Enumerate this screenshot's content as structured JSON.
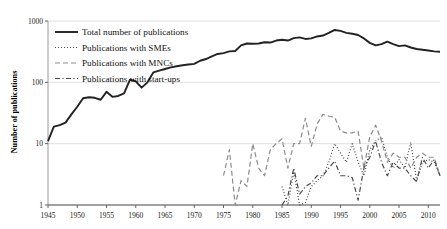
{
  "chart_data": {
    "type": "line",
    "title": "",
    "xlabel": "",
    "ylabel": "Number of publications",
    "yscale": "log",
    "ylim": [
      1,
      1000
    ],
    "xlim": [
      1945,
      2012
    ],
    "grid": true,
    "legend_position": "top-left",
    "ytick_labels": [
      "1000",
      "100",
      "10",
      "1"
    ],
    "ytick_values": [
      1000,
      100,
      10,
      1
    ],
    "xtick_labels": [
      "1945",
      "1950",
      "1955",
      "1960",
      "1965",
      "1970",
      "1975",
      "1980",
      "1985",
      "1990",
      "1995",
      "2000",
      "2005",
      "2010"
    ],
    "xtick_values": [
      1945,
      1950,
      1955,
      1960,
      1965,
      1970,
      1975,
      1980,
      1985,
      1990,
      1995,
      2000,
      2005,
      2010
    ],
    "series": [
      {
        "name": "Total number of publications",
        "style": "solid",
        "color": "#222222",
        "width": 1.9,
        "x": [
          1945,
          1946,
          1947,
          1948,
          1949,
          1950,
          1951,
          1952,
          1953,
          1954,
          1955,
          1956,
          1957,
          1958,
          1959,
          1960,
          1961,
          1962,
          1963,
          1964,
          1965,
          1966,
          1967,
          1968,
          1969,
          1970,
          1971,
          1972,
          1973,
          1974,
          1975,
          1976,
          1977,
          1978,
          1979,
          1980,
          1981,
          1982,
          1983,
          1984,
          1985,
          1986,
          1987,
          1988,
          1989,
          1990,
          1991,
          1992,
          1993,
          1994,
          1995,
          1996,
          1997,
          1998,
          1999,
          2000,
          2001,
          2002,
          2003,
          2004,
          2005,
          2006,
          2007,
          2008,
          2009,
          2010,
          2011,
          2012
        ],
        "values": [
          11,
          19,
          20,
          22,
          30,
          40,
          55,
          57,
          56,
          52,
          70,
          58,
          60,
          66,
          110,
          104,
          82,
          100,
          145,
          155,
          165,
          175,
          183,
          190,
          195,
          200,
          225,
          240,
          265,
          290,
          300,
          320,
          325,
          400,
          430,
          425,
          430,
          450,
          445,
          480,
          495,
          480,
          525,
          540,
          510,
          520,
          560,
          580,
          640,
          715,
          690,
          640,
          620,
          590,
          520,
          440,
          400,
          420,
          460,
          420,
          390,
          400,
          370,
          350,
          340,
          330,
          320,
          315
        ]
      },
      {
        "name": "Publications with SMEs",
        "style": "dotted",
        "color": "#3a3a3a",
        "width": 1.2,
        "x": [
          1985,
          1986,
          1987,
          1988,
          1989,
          1990,
          1991,
          1992,
          1993,
          1994,
          1995,
          1996,
          1997,
          1998,
          1999,
          2000,
          2001,
          2002,
          2003,
          2004,
          2005,
          2006,
          2007,
          2008,
          2009,
          2010,
          2011,
          2012
        ],
        "values": [
          2,
          1,
          3.5,
          1,
          1.1,
          2,
          2.5,
          3,
          5,
          10,
          7,
          5,
          10,
          5,
          3,
          8,
          11,
          13,
          6,
          4,
          5.5,
          4,
          10.5,
          2.5,
          5,
          5.5,
          5,
          3
        ]
      },
      {
        "name": "Publications with MNCs",
        "style": "longdash",
        "color": "#8c8c8c",
        "width": 1.2,
        "x": [
          1975,
          1976,
          1977,
          1978,
          1979,
          1980,
          1981,
          1982,
          1983,
          1984,
          1985,
          1986,
          1987,
          1988,
          1989,
          1990,
          1991,
          1992,
          1993,
          1994,
          1995,
          1996,
          1997,
          1998,
          1999,
          2000,
          2001,
          2002,
          2003,
          2004,
          2005,
          2006,
          2007,
          2008,
          2009,
          2010,
          2011,
          2012
        ],
        "values": [
          3,
          8,
          1,
          2.5,
          2,
          10,
          4,
          3,
          8,
          10,
          12,
          4,
          10,
          10,
          26,
          9,
          21,
          30,
          28,
          27,
          16,
          15,
          15,
          16,
          4,
          13,
          20,
          11,
          5,
          7,
          6,
          6,
          4,
          6,
          7,
          6,
          6,
          3
        ]
      },
      {
        "name": "Publications with start-ups",
        "style": "dashdot",
        "color": "#4a4a4a",
        "width": 1.2,
        "x": [
          1985,
          1986,
          1987,
          1988,
          1989,
          1990,
          1991,
          1992,
          1993,
          1994,
          1995,
          1996,
          1997,
          1998,
          1999,
          2000,
          2001,
          2002,
          2003,
          2004,
          2005,
          2006,
          2007,
          2008,
          2009,
          2010,
          2011,
          2012
        ],
        "values": [
          1,
          1.4,
          4,
          1.5,
          2,
          2.3,
          3,
          3,
          4,
          5.2,
          3,
          3,
          2.8,
          1.2,
          4,
          6,
          11,
          5,
          3,
          5,
          4,
          4,
          3,
          2.4,
          6,
          4,
          5.5,
          3
        ]
      }
    ]
  },
  "legend": {
    "items": [
      {
        "label": "Total number of publications",
        "style": "solid"
      },
      {
        "label": "Publications with SMEs",
        "style": "dotted"
      },
      {
        "label": "Publications with MNCs",
        "style": "longdash"
      },
      {
        "label": "Publications with start-ups",
        "style": "dashdot"
      }
    ]
  },
  "axis": {
    "y_title": "Number of publications"
  }
}
